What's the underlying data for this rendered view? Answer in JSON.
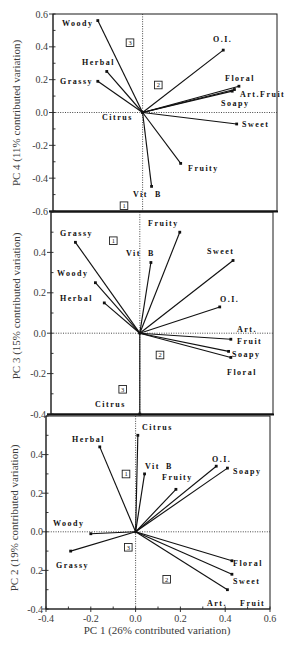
{
  "chart_data": [
    {
      "type": "scatter",
      "subtype": "biplot",
      "title": "",
      "xlabel": "",
      "ylabel": "PC 4 (11% contributed variation)",
      "xlim": [
        -0.4,
        0.6
      ],
      "ylim": [
        -0.6,
        0.6
      ],
      "grid": false,
      "reference_lines": "dotted lines at x=0 and y=0",
      "yticks": [
        {
          "value": 0.6,
          "label": "0.6"
        },
        {
          "value": 0.4,
          "label": "0.4"
        },
        {
          "value": 0.2,
          "label": "0.2"
        },
        {
          "value": 0.0,
          "label": "0.0"
        },
        {
          "value": -0.2,
          "label": "-0.2"
        },
        {
          "value": -0.4,
          "label": "-0.4"
        },
        {
          "value": -0.6,
          "label": "-0.6"
        }
      ],
      "xticks": [],
      "points": [
        {
          "name": "Woody",
          "label_parts": [
            "Woody"
          ],
          "x": -0.2,
          "y": 0.56
        },
        {
          "name": "Herbal",
          "label_parts": [
            "Herbal"
          ],
          "x": -0.16,
          "y": 0.25
        },
        {
          "name": "Grassy",
          "label_parts": [
            "Grassy"
          ],
          "x": -0.2,
          "y": 0.19
        },
        {
          "name": "Citrus",
          "label_parts": [
            "Citrus"
          ],
          "x": 0.0,
          "y": 0.0
        },
        {
          "name": "Vit B",
          "label_parts": [
            "Vit",
            "B"
          ],
          "x": 0.04,
          "y": -0.45
        },
        {
          "name": "Fruity",
          "label_parts": [
            "Fruity"
          ],
          "x": 0.17,
          "y": -0.31
        },
        {
          "name": "Sweet",
          "label_parts": [
            "Sweet"
          ],
          "x": 0.42,
          "y": -0.07
        },
        {
          "name": "Soapy",
          "label_parts": [
            "Soapy"
          ],
          "x": 0.4,
          "y": 0.13
        },
        {
          "name": "Art. Fruit",
          "label_parts": [
            "Art.Fruit"
          ],
          "x": 0.41,
          "y": 0.14
        },
        {
          "name": "Floral",
          "label_parts": [
            "Floral"
          ],
          "x": 0.43,
          "y": 0.16
        },
        {
          "name": "O.I.",
          "label_parts": [
            "O.I."
          ],
          "x": 0.36,
          "y": 0.38
        }
      ],
      "quadrant_labels": [
        "3",
        "2",
        "1"
      ]
    },
    {
      "type": "scatter",
      "subtype": "biplot",
      "title": "",
      "xlabel": "",
      "ylabel": "PC 3 (15% contributed variation)",
      "xlim": [
        -0.4,
        0.6
      ],
      "ylim": [
        -0.4,
        0.6
      ],
      "grid": false,
      "reference_lines": "dotted lines at x=0 and y=0",
      "yticks": [
        {
          "value": 0.4,
          "label": "0.4"
        },
        {
          "value": 0.2,
          "label": "0.2"
        },
        {
          "value": 0.0,
          "label": "0.0"
        },
        {
          "value": -0.2,
          "label": "-0.2"
        },
        {
          "value": -0.4,
          "label": "-0.4"
        }
      ],
      "xticks": [],
      "points": [
        {
          "name": "Grassy",
          "label_parts": [
            "Grassy"
          ],
          "x": -0.29,
          "y": 0.45
        },
        {
          "name": "Woody",
          "label_parts": [
            "Woody"
          ],
          "x": -0.2,
          "y": 0.25
        },
        {
          "name": "Herbal",
          "label_parts": [
            "Herbal"
          ],
          "x": -0.16,
          "y": 0.15
        },
        {
          "name": "Vit B",
          "label_parts": [
            "Vit",
            "B"
          ],
          "x": 0.05,
          "y": 0.35
        },
        {
          "name": "Fruity",
          "label_parts": [
            "Fruity"
          ],
          "x": 0.18,
          "y": 0.5
        },
        {
          "name": "Sweet",
          "label_parts": [
            "Sweet"
          ],
          "x": 0.42,
          "y": 0.36
        },
        {
          "name": "O.I.",
          "label_parts": [
            "O.I."
          ],
          "x": 0.36,
          "y": 0.13
        },
        {
          "name": "Art. Fruit",
          "label_parts": [
            "Art.",
            "Fruit"
          ],
          "x": 0.41,
          "y": -0.03
        },
        {
          "name": "Soapy",
          "label_parts": [
            "Soapy"
          ],
          "x": 0.4,
          "y": -0.09
        },
        {
          "name": "Floral",
          "label_parts": [
            "Floral"
          ],
          "x": 0.41,
          "y": -0.12
        },
        {
          "name": "Citrus",
          "label_parts": [
            "Citrus"
          ],
          "x": 0.0,
          "y": -0.4
        }
      ],
      "quadrant_labels": [
        "1",
        "2",
        "3"
      ]
    },
    {
      "type": "scatter",
      "subtype": "biplot",
      "title": "",
      "xlabel": "PC 1 (26% contributed variation)",
      "ylabel": "PC 2 (19% contributed variation)",
      "xlim": [
        -0.4,
        0.6
      ],
      "ylim": [
        -0.4,
        0.6
      ],
      "grid": false,
      "reference_lines": "dotted lines at x=0 and y=0",
      "yticks": [
        {
          "value": 0.4,
          "label": "0.4"
        },
        {
          "value": 0.2,
          "label": "0.2"
        },
        {
          "value": 0.0,
          "label": "0.0"
        },
        {
          "value": -0.2,
          "label": "0.2"
        },
        {
          "value": -0.4,
          "label": "-0.4"
        }
      ],
      "xticks": [
        {
          "value": -0.4,
          "label": "-0.4"
        },
        {
          "value": -0.2,
          "label": "-0.2"
        },
        {
          "value": 0.0,
          "label": "0.0"
        },
        {
          "value": 0.2,
          "label": "0.2"
        },
        {
          "value": 0.4,
          "label": "0.4"
        },
        {
          "value": 0.6,
          "label": "0.6"
        }
      ],
      "points": [
        {
          "name": "Citrus",
          "label_parts": [
            "Citrus"
          ],
          "x": 0.01,
          "y": 0.5
        },
        {
          "name": "Herbal",
          "label_parts": [
            "Herbal"
          ],
          "x": -0.16,
          "y": 0.44
        },
        {
          "name": "Vit B",
          "label_parts": [
            "Vit",
            "B"
          ],
          "x": 0.04,
          "y": 0.3
        },
        {
          "name": "Fruity",
          "label_parts": [
            "Fruity"
          ],
          "x": 0.18,
          "y": 0.22
        },
        {
          "name": "O.I.",
          "label_parts": [
            "O.I."
          ],
          "x": 0.36,
          "y": 0.34
        },
        {
          "name": "Soapy",
          "label_parts": [
            "Soapy"
          ],
          "x": 0.41,
          "y": 0.33
        },
        {
          "name": "Woody",
          "label_parts": [
            "Woody"
          ],
          "x": -0.2,
          "y": -0.01
        },
        {
          "name": "Grassy",
          "label_parts": [
            "Grassy"
          ],
          "x": -0.29,
          "y": -0.1
        },
        {
          "name": "Floral",
          "label_parts": [
            "Floral"
          ],
          "x": 0.43,
          "y": -0.15
        },
        {
          "name": "Sweet",
          "label_parts": [
            "Sweet"
          ],
          "x": 0.43,
          "y": -0.22
        },
        {
          "name": "Art. Fruit",
          "label_parts": [
            "Art.",
            "Fruit"
          ],
          "x": 0.41,
          "y": -0.3
        }
      ],
      "quadrant_labels": [
        "1",
        "3",
        "2"
      ]
    }
  ]
}
